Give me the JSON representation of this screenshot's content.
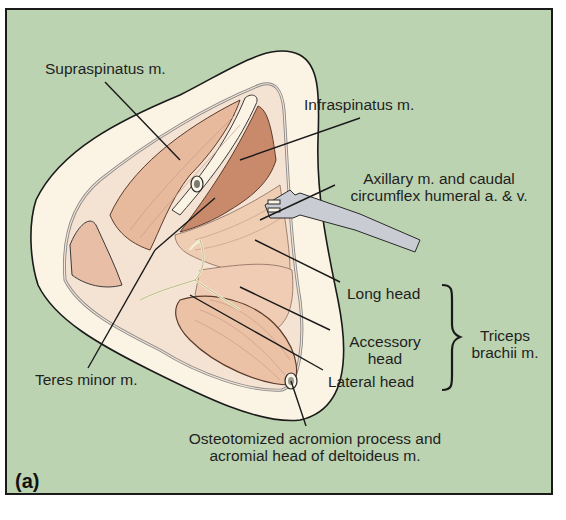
{
  "figure": {
    "panel_label": "(a)",
    "background_color": "#bcd3b2",
    "border_color": "#1a1a1a"
  },
  "labels": {
    "supraspinatus": "Supraspinatus m.",
    "infraspinatus": "Infraspinatus m.",
    "axillary_line1": "Axillary m. and caudal",
    "axillary_line2": "circumflex humeral a. & v.",
    "long_head": "Long head",
    "accessory_line1": "Accessory",
    "accessory_line2": "head",
    "lateral_head": "Lateral head",
    "triceps_line1": "Triceps",
    "triceps_line2": "brachii m.",
    "teres_minor": "Teres minor m.",
    "osteotomized_line1": "Osteotomized acromion process and",
    "osteotomized_line2": "acromial head of deltoideus m."
  },
  "colors": {
    "skin": "#fbf4e4",
    "muscle_light": "#edc7ab",
    "muscle_dark": "#c98a6c",
    "retractor": "#c9ccd2",
    "nerve": "#f3efd3",
    "line": "#1a1a1a"
  }
}
